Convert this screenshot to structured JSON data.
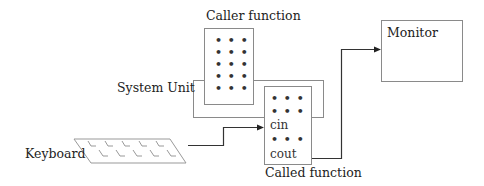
{
  "diagram": {
    "title_labels": {
      "caller_function": "Caller function",
      "called_function": "Called function",
      "system_unit": "System Unit",
      "keyboard": "Keyboard",
      "monitor": "Monitor"
    },
    "caller_box": {
      "rows": [
        "• • •",
        "• • •",
        "• • •",
        "• • •",
        "• • •"
      ]
    },
    "called_box": {
      "rows": [
        "• • •",
        "• • •",
        "cin",
        "• • •",
        "cout"
      ]
    },
    "connections": [
      {
        "from": "Keyboard",
        "to": "cin",
        "type": "arrow"
      },
      {
        "from": "cout",
        "to": "Monitor",
        "type": "arrow"
      }
    ],
    "colors": {
      "box_stroke": "#888888",
      "arrow_stroke": "#333333",
      "text": "#222222"
    }
  }
}
